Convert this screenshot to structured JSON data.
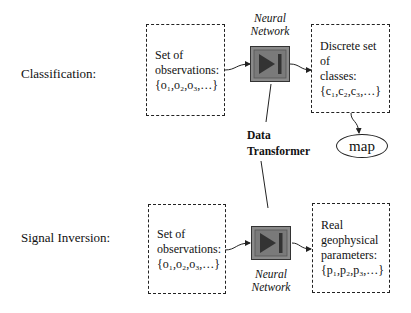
{
  "rows": {
    "classification": {
      "label": "Classification:",
      "input_box": {
        "line1": "Set of",
        "line2": "observations:",
        "line3": "{o₁,o₂,o₃,…}"
      },
      "network_label": {
        "line1": "Neural",
        "line2": "Network"
      },
      "output_box": {
        "line1": "Discrete set of",
        "line2": "classes:",
        "line3": "{c₁,c₂,c₃,…}"
      },
      "map_label": "map"
    },
    "signal_inversion": {
      "label": "Signal Inversion:",
      "input_box": {
        "line1": "Set of",
        "line2": "observations:",
        "line3": "{o₁,o₂,o₃,…}"
      },
      "network_label": {
        "line1": "Neural",
        "line2": "Network"
      },
      "output_box": {
        "line1": "Real",
        "line2": "geophysical",
        "line3": "parameters:",
        "line4": "{p₁,p₂,p₃,…}"
      }
    }
  },
  "connector": {
    "line1": "Data",
    "line2": "Transformer"
  },
  "icons": {
    "network_icon": "play-to-end-icon"
  },
  "colors": {
    "network_fill": "#8a8a8a",
    "network_inner": "#6e6e6e",
    "triangle": "#333333",
    "stroke": "#222222"
  }
}
